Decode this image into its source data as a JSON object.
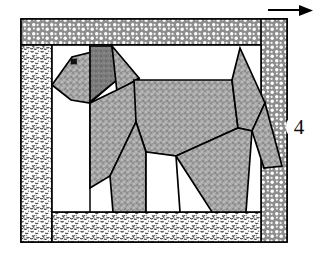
{
  "diagram": {
    "block_number": "4",
    "arrow": {
      "name": "direction-arrow",
      "label": "",
      "direction": "right"
    },
    "colors": {
      "patch_gray": "#9e9e9e",
      "patch_dark_gray": "#787878",
      "background_white": "#ffffff",
      "outline_black": "#000000",
      "border_coarse_dots": "#8a8a8a",
      "border_fine_speckle": "#b5b5b5"
    },
    "borders": [
      {
        "name": "top-border-band",
        "texture": "coarse-dots",
        "label": ""
      },
      {
        "name": "right-border-band",
        "texture": "coarse-dots",
        "label": ""
      },
      {
        "name": "left-border-band",
        "texture": "fine-speckle",
        "label": ""
      },
      {
        "name": "bottom-border-band",
        "texture": "fine-speckle",
        "label": ""
      }
    ],
    "figure": {
      "name": "dog-figure",
      "parts": [
        {
          "name": "dog-head",
          "shade": "gray"
        },
        {
          "name": "dog-ear",
          "shade": "dark-gray"
        },
        {
          "name": "dog-eye",
          "shade": "black"
        },
        {
          "name": "dog-neck",
          "shade": "gray"
        },
        {
          "name": "dog-body",
          "shade": "gray"
        },
        {
          "name": "dog-front-leg",
          "shade": "gray"
        },
        {
          "name": "dog-hind-leg",
          "shade": "gray"
        },
        {
          "name": "dog-tail",
          "shade": "gray"
        }
      ]
    }
  }
}
